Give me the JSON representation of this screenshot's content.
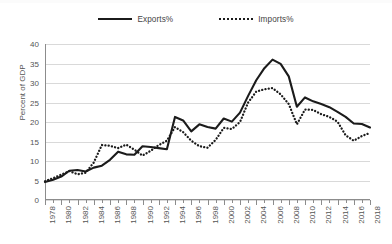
{
  "legend": {
    "position": "top-center",
    "entries": [
      {
        "label": "Exports%",
        "style": "solid",
        "icon": "solid-line-key"
      },
      {
        "label": "Imports%",
        "style": "dotted",
        "icon": "dotted-line-key"
      }
    ]
  },
  "axes": {
    "y_title": "Percent of GDP",
    "y_ticks": [
      "0",
      "5",
      "10",
      "15",
      "20",
      "25",
      "30",
      "35",
      "40"
    ],
    "x_labels": [
      "1978",
      "1980",
      "1982",
      "1984",
      "1986",
      "1988",
      "1990",
      "1992",
      "1994",
      "1996",
      "1998",
      "2000",
      "2002",
      "2004",
      "2006",
      "2008",
      "2010",
      "2012",
      "2014",
      "2016",
      "2018"
    ]
  },
  "colors": {
    "line": "#1b1b1b",
    "gridline": "#d9d9d9",
    "axis": "#8c8c8c",
    "text": "#555555",
    "background": "#ffffff"
  },
  "chart_data": {
    "type": "line",
    "title": "",
    "subtitle": "",
    "xlabel": "",
    "ylabel": "Percent of GDP",
    "xlim": [
      1978,
      2018
    ],
    "ylim": [
      0,
      40
    ],
    "ytick_step": 5,
    "grid": true,
    "legend_position": "top-center",
    "x": [
      1978,
      1979,
      1980,
      1981,
      1982,
      1983,
      1984,
      1985,
      1986,
      1987,
      1988,
      1989,
      1990,
      1991,
      1992,
      1993,
      1994,
      1995,
      1996,
      1997,
      1998,
      1999,
      2000,
      2001,
      2002,
      2003,
      2004,
      2005,
      2006,
      2007,
      2008,
      2009,
      2010,
      2011,
      2012,
      2013,
      2014,
      2015,
      2016,
      2017,
      2018
    ],
    "series": [
      {
        "name": "Exports%",
        "style": "solid",
        "values": [
          4.6,
          5.2,
          6.0,
          7.5,
          7.7,
          7.3,
          8.3,
          8.8,
          10.3,
          12.4,
          11.7,
          11.6,
          13.8,
          13.6,
          13.3,
          13.0,
          21.3,
          20.4,
          17.6,
          19.4,
          18.7,
          18.3,
          20.9,
          20.1,
          22.4,
          26.7,
          30.7,
          33.8,
          36.0,
          34.9,
          31.7,
          23.9,
          26.3,
          25.3,
          24.6,
          23.8,
          22.6,
          21.3,
          19.6,
          19.5,
          18.6
        ]
      },
      {
        "name": "Imports%",
        "style": "dotted",
        "values": [
          4.8,
          5.6,
          6.5,
          7.4,
          6.6,
          7.0,
          9.6,
          14.1,
          13.9,
          13.3,
          14.2,
          12.9,
          11.4,
          12.6,
          14.1,
          15.2,
          18.7,
          17.4,
          15.2,
          13.8,
          13.4,
          15.4,
          18.5,
          18.2,
          20.0,
          25.0,
          27.8,
          28.4,
          28.7,
          27.1,
          24.6,
          19.4,
          23.2,
          23.1,
          22.0,
          21.3,
          20.1,
          16.6,
          15.2,
          16.4,
          17.2
        ]
      }
    ]
  }
}
